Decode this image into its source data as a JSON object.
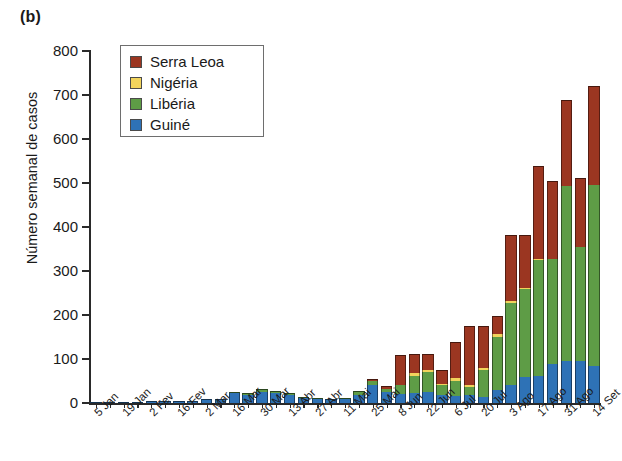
{
  "panel": {
    "label": "(b)"
  },
  "chart_data": {
    "type": "bar",
    "stacked": true,
    "title": "",
    "subtitle": "",
    "xlabel": "",
    "ylabel": "Número semanal de casos",
    "ylim": [
      0,
      800
    ],
    "yticks": [
      0,
      100,
      200,
      300,
      400,
      500,
      600,
      700,
      800
    ],
    "grid": false,
    "legend_position": "top-left-inside",
    "legend_entries": [
      "Serra Leoa",
      "Nigéria",
      "Libéria",
      "Guiné"
    ],
    "colors": {
      "Serra Leoa": "#9B3621",
      "Nigéria": "#F2D45C",
      "Libéria": "#5E9C46",
      "Guiné": "#2E72B6"
    },
    "categories": [
      "5 Jan",
      "12 Jan",
      "19 Jan",
      "26 Jan",
      "2 Fev",
      "9 Fev",
      "16 Fev",
      "23 Fev",
      "2 Mar",
      "9 Mar",
      "16 Mar",
      "23 Mar",
      "30 Mar",
      "6 Abr",
      "13 Abr",
      "20 Abr",
      "27 Abr",
      "4 Mai",
      "11 Mai",
      "18 Mai",
      "25 Mai",
      "1 Jun",
      "8 Jun",
      "15 Jun",
      "22 Jun",
      "29 Jun",
      "6 Jul",
      "13 Jul",
      "20 Jul",
      "27 Jul",
      "3 Ago",
      "10 Ago",
      "17 Ago",
      "24 Ago",
      "31 Ago",
      "7 Set",
      "14 Set"
    ],
    "tick_labels": [
      "5 Jan",
      "19 Jan",
      "2 Fev",
      "16 Fev",
      "2 Mar",
      "16 Mar",
      "30 Mar",
      "13 Abr",
      "27 Abr",
      "11 Mai",
      "25 Mai",
      "8 Jun",
      "22 Jun",
      "6 Jul",
      "20 Jul",
      "3 Ago",
      "17 Ago",
      "31 Ago",
      "14 Set"
    ],
    "tick_label_indices": [
      0,
      2,
      4,
      6,
      8,
      10,
      12,
      14,
      16,
      18,
      20,
      22,
      24,
      26,
      28,
      30,
      32,
      34,
      36
    ],
    "series": [
      {
        "name": "Guiné",
        "values": [
          1,
          2,
          2,
          3,
          4,
          5,
          5,
          5,
          8,
          10,
          22,
          18,
          25,
          22,
          18,
          12,
          8,
          8,
          10,
          18,
          40,
          24,
          20,
          22,
          24,
          18,
          16,
          18,
          14,
          30,
          42,
          60,
          62,
          88,
          96,
          96,
          84
        ]
      },
      {
        "name": "Libéria",
        "values": [
          0,
          0,
          0,
          0,
          0,
          0,
          0,
          0,
          0,
          0,
          4,
          4,
          6,
          6,
          4,
          2,
          2,
          0,
          2,
          10,
          10,
          8,
          20,
          40,
          46,
          24,
          34,
          18,
          62,
          120,
          186,
          200,
          262,
          240,
          398,
          258,
          412
        ]
      },
      {
        "name": "Nigéria",
        "values": [
          0,
          0,
          0,
          0,
          0,
          0,
          0,
          0,
          0,
          0,
          0,
          0,
          0,
          0,
          0,
          0,
          0,
          0,
          0,
          0,
          0,
          0,
          0,
          6,
          4,
          2,
          8,
          6,
          4,
          6,
          4,
          2,
          2,
          0,
          0,
          0,
          0
        ]
      },
      {
        "name": "Serra Leoa",
        "values": [
          0,
          0,
          0,
          0,
          0,
          0,
          0,
          0,
          0,
          0,
          0,
          0,
          0,
          0,
          0,
          0,
          0,
          0,
          0,
          0,
          4,
          6,
          70,
          44,
          38,
          30,
          80,
          134,
          96,
          42,
          150,
          120,
          212,
          176,
          194,
          158,
          224
        ]
      }
    ],
    "totals": [
      1,
      2,
      2,
      3,
      4,
      5,
      5,
      5,
      8,
      10,
      26,
      22,
      31,
      28,
      22,
      14,
      10,
      8,
      12,
      28,
      54,
      38,
      110,
      112,
      112,
      74,
      138,
      176,
      176,
      198,
      382,
      382,
      538,
      504,
      688,
      512,
      720
    ]
  }
}
